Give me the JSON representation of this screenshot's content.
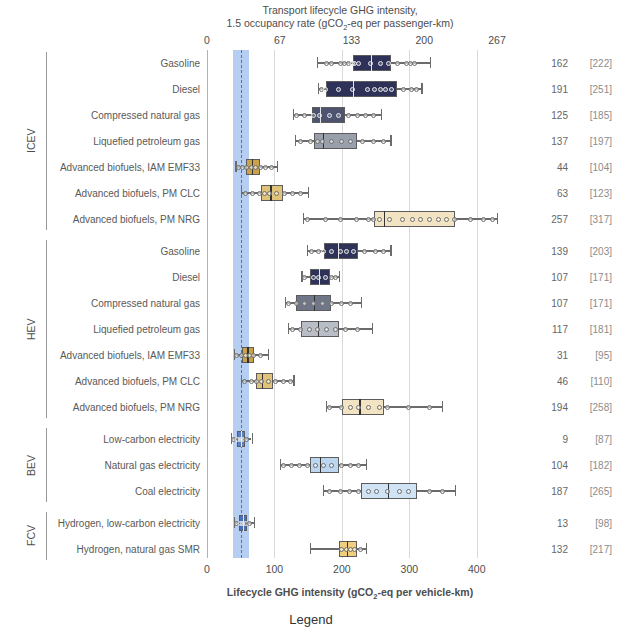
{
  "titles": {
    "top_line1": "Transport lifecycle GHG intensity,",
    "top_line2_pre": "1.5 occupancy rate (gCO",
    "top_line2_sub": "2",
    "top_line2_post": "-eq per passenger-km)",
    "bottom_pre": "Lifecycle GHG intensity (gCO",
    "bottom_sub": "2",
    "bottom_post": "-eq per vehicle-km)",
    "legend": "Legend"
  },
  "axes": {
    "top_ticks": [
      "0",
      "67",
      "133",
      "200",
      "267"
    ],
    "top_values": [
      0,
      67,
      133,
      200,
      267
    ],
    "bottom_ticks": [
      "0",
      "100",
      "200",
      "300",
      "400"
    ],
    "bottom_values": [
      0,
      100,
      200,
      300,
      400
    ],
    "xmin": 0,
    "xmax": 430
  },
  "reference_band": {
    "low": 38,
    "high": 63,
    "center": 50
  },
  "groups": [
    {
      "label": "ICEV",
      "start": 0,
      "count": 7
    },
    {
      "label": "HEV",
      "start": 7,
      "count": 7
    },
    {
      "label": "BEV",
      "start": 14,
      "count": 3
    },
    {
      "label": "FCV",
      "start": 17,
      "count": 2
    }
  ],
  "chart_data": {
    "type": "table",
    "xlabel": "Lifecycle GHG intensity (gCO2-eq per vehicle-km)",
    "xlabel_secondary": "Transport lifecycle GHG intensity, 1.5 occupancy rate (gCO2-eq per passenger-km)",
    "ylabel": "",
    "xlim": [
      0,
      430
    ],
    "grid": true,
    "legend_position": "below",
    "rows": [
      {
        "group": "ICEV",
        "label": "Gasoline",
        "median_passenger": "162",
        "bracket": "[222]",
        "color": "#2e3259",
        "dark": true,
        "whisk_lo": 163,
        "q1": 216,
        "median": 243,
        "q3": 273,
        "whisk_hi": 330,
        "points": [
          178,
          186,
          198,
          205,
          210,
          216,
          219,
          226,
          243,
          258,
          270,
          283,
          296,
          302,
          308
        ]
      },
      {
        "group": "ICEV",
        "label": "Diesel",
        "median_passenger": "191",
        "bracket": "[251]",
        "color": "#2e3259",
        "dark": true,
        "whisk_lo": 164,
        "q1": 176,
        "median": 216,
        "q3": 281,
        "whisk_hi": 318,
        "points": [
          170,
          176,
          196,
          216,
          238,
          249,
          258,
          266,
          274,
          292,
          304,
          312
        ]
      },
      {
        "group": "ICEV",
        "label": "Compressed natural gas",
        "median_passenger": "125",
        "bracket": "[185]",
        "color": "#4e5470",
        "dark": true,
        "whisk_lo": 127,
        "q1": 155,
        "median": 168,
        "q3": 204,
        "whisk_hi": 258,
        "points": [
          133,
          146,
          158,
          168,
          182,
          196,
          210,
          224,
          236,
          248
        ]
      },
      {
        "group": "ICEV",
        "label": "Liquefied petroleum gas",
        "median_passenger": "137",
        "bracket": "[197]",
        "color": "#9aa0ab",
        "dark": false,
        "whisk_lo": 130,
        "q1": 158,
        "median": 172,
        "q3": 222,
        "whisk_hi": 272,
        "points": [
          140,
          154,
          164,
          172,
          186,
          200,
          214,
          232,
          248,
          262
        ]
      },
      {
        "group": "ICEV",
        "label": "Advanced biofuels, IAM EMF33",
        "median_passenger": "44",
        "bracket": "[104]",
        "color": "#c9a24a",
        "dark": false,
        "whisk_lo": 42,
        "q1": 58,
        "median": 66,
        "q3": 78,
        "whisk_hi": 104,
        "points": [
          48,
          54,
          60,
          66,
          72,
          80,
          88,
          96
        ]
      },
      {
        "group": "ICEV",
        "label": "Advanced biofuels, PM CLC",
        "median_passenger": "63",
        "bracket": "[123]",
        "color": "#e0c279",
        "dark": false,
        "whisk_lo": 50,
        "q1": 80,
        "median": 94,
        "q3": 112,
        "whisk_hi": 150,
        "points": [
          58,
          68,
          78,
          86,
          94,
          104,
          116,
          128,
          140
        ]
      },
      {
        "group": "ICEV",
        "label": "Advanced biofuels, PM NRG",
        "median_passenger": "257",
        "bracket": "[317]",
        "color": "#f2e3c2",
        "dark": false,
        "whisk_lo": 142,
        "q1": 248,
        "median": 262,
        "q3": 368,
        "whisk_hi": 430,
        "points": [
          150,
          176,
          198,
          222,
          240,
          248,
          256,
          272,
          290,
          306,
          318,
          330,
          344,
          356,
          368,
          392,
          410,
          424
        ]
      },
      {
        "group": "HEV",
        "label": "Gasoline",
        "median_passenger": "139",
        "bracket": "[203]",
        "color": "#2e3259",
        "dark": true,
        "whisk_lo": 148,
        "q1": 174,
        "median": 194,
        "q3": 224,
        "whisk_hi": 272,
        "points": [
          155,
          166,
          174,
          186,
          198,
          208,
          218,
          234,
          250,
          262
        ]
      },
      {
        "group": "HEV",
        "label": "Diesel",
        "median_passenger": "107",
        "bracket": "[171]",
        "color": "#2e3259",
        "dark": true,
        "whisk_lo": 140,
        "q1": 152,
        "median": 166,
        "q3": 182,
        "whisk_hi": 196,
        "points": [
          146,
          158,
          166,
          176,
          186,
          192
        ]
      },
      {
        "group": "HEV",
        "label": "Compressed natural gas",
        "median_passenger": "107",
        "bracket": "[171]",
        "color": "#6f7687",
        "dark": false,
        "whisk_lo": 116,
        "q1": 132,
        "median": 158,
        "q3": 184,
        "whisk_hi": 228,
        "points": [
          122,
          134,
          146,
          158,
          172,
          186,
          200,
          214
        ]
      },
      {
        "group": "HEV",
        "label": "Liquefied petroleum gas",
        "median_passenger": "117",
        "bracket": "[181]",
        "color": "#b8bdc6",
        "dark": false,
        "whisk_lo": 120,
        "q1": 140,
        "median": 164,
        "q3": 196,
        "whisk_hi": 244,
        "points": [
          128,
          140,
          152,
          164,
          178,
          192,
          206,
          224
        ]
      },
      {
        "group": "HEV",
        "label": "Advanced biofuels, IAM EMF33",
        "median_passenger": "31",
        "bracket": "[95]",
        "color": "#c9a24a",
        "dark": false,
        "whisk_lo": 40,
        "q1": 52,
        "median": 60,
        "q3": 70,
        "whisk_hi": 90,
        "points": [
          44,
          52,
          58,
          64,
          70,
          80
        ]
      },
      {
        "group": "HEV",
        "label": "Advanced biofuels, PM CLC",
        "median_passenger": "46",
        "bracket": "[110]",
        "color": "#e0c279",
        "dark": false,
        "whisk_lo": 50,
        "q1": 72,
        "median": 82,
        "q3": 98,
        "whisk_hi": 128,
        "points": [
          56,
          66,
          74,
          82,
          92,
          102,
          114,
          124
        ]
      },
      {
        "group": "HEV",
        "label": "Advanced biofuels, PM NRG",
        "median_passenger": "194",
        "bracket": "[258]",
        "color": "#f2e3c2",
        "dark": false,
        "whisk_lo": 176,
        "q1": 200,
        "median": 226,
        "q3": 262,
        "whisk_hi": 348,
        "points": [
          182,
          200,
          214,
          226,
          240,
          256,
          268,
          300,
          330
        ]
      },
      {
        "group": "BEV",
        "label": "Low-carbon electricity",
        "median_passenger": "9",
        "bracket": "[87]",
        "color": "#5b7fbf",
        "dark": true,
        "whisk_lo": 36,
        "q1": 44,
        "median": 50,
        "q3": 57,
        "whisk_hi": 66,
        "points": [
          40,
          46,
          50,
          54,
          60
        ]
      },
      {
        "group": "BEV",
        "label": "Natural gas electricity",
        "median_passenger": "104",
        "bracket": "[182]",
        "color": "#bcd6ef",
        "dark": false,
        "whisk_lo": 108,
        "q1": 152,
        "median": 168,
        "q3": 196,
        "whisk_hi": 236,
        "points": [
          114,
          126,
          138,
          150,
          162,
          174,
          186,
          200,
          214,
          226
        ]
      },
      {
        "group": "BEV",
        "label": "Coal electricity",
        "median_passenger": "187",
        "bracket": "[265]",
        "color": "#cfe3f5",
        "dark": false,
        "whisk_lo": 172,
        "q1": 228,
        "median": 268,
        "q3": 312,
        "whisk_hi": 368,
        "points": [
          182,
          198,
          212,
          226,
          240,
          252,
          268,
          286,
          300,
          330,
          350
        ]
      },
      {
        "group": "FCV",
        "label": "Hydrogen, low-carbon electricity",
        "median_passenger": "13",
        "bracket": "[98]",
        "color": "#4a70b5",
        "dark": true,
        "whisk_lo": 40,
        "q1": 48,
        "median": 53,
        "q3": 60,
        "whisk_hi": 70,
        "points": [
          44,
          50,
          54,
          58,
          64
        ]
      },
      {
        "group": "FCV",
        "label": "Hydrogen, natural gas SMR",
        "median_passenger": "132",
        "bracket": "[217]",
        "color": "#efcf7e",
        "dark": false,
        "whisk_lo": 152,
        "q1": 196,
        "median": 208,
        "q3": 222,
        "whisk_hi": 236,
        "points": [
          200,
          208,
          214,
          220,
          228
        ]
      }
    ]
  }
}
